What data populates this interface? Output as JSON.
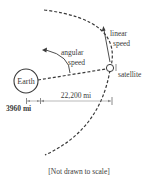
{
  "diagram": {
    "labels": {
      "earth": "Earth",
      "satellite": "satellite",
      "linear_speed_line1": "linear",
      "linear_speed_line2": "speed",
      "angular_speed_line1": "angular",
      "angular_speed_line2": "speed",
      "orbit_distance": "22,200 mi",
      "earth_radius": "3960 mi",
      "caption": "[Not drawn to scale]"
    },
    "colors": {
      "stroke": "#3a3a3a",
      "text": "#3a3a3a",
      "dimension_line": "#8a8a8a"
    }
  }
}
